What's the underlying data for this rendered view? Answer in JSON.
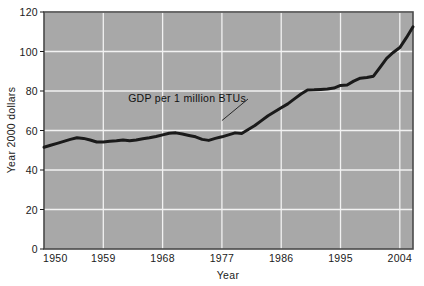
{
  "chart_data": {
    "type": "line",
    "title": "",
    "subtitle": "",
    "xlabel": "Year",
    "ylabel": "Year 2000 dollars",
    "xlim": [
      1950,
      2006
    ],
    "ylim": [
      0,
      120
    ],
    "xticks": [
      "1950",
      "1959",
      "1968",
      "1977",
      "1986",
      "1995",
      "2004"
    ],
    "xtick_values": [
      1950,
      1959,
      1968,
      1977,
      1986,
      1995,
      2004
    ],
    "yticks": [
      "0",
      "20",
      "40",
      "60",
      "80",
      "100",
      "120"
    ],
    "ytick_values": [
      0,
      20,
      40,
      60,
      80,
      100,
      120
    ],
    "grid": true,
    "grid_color": "#f2f2f2",
    "plot_background": "#a8a8a8",
    "legend": "none",
    "annotations": [
      {
        "text": "GDP per 1 million BTUs",
        "x": 1972,
        "y": 70,
        "leader_to_x": 1977,
        "leader_to_y": 65
      }
    ],
    "series": [
      {
        "name": "GDP per 1 million BTUs",
        "color": "#1a1a1a",
        "line_width": 3,
        "x": [
          1950,
          1951,
          1952,
          1953,
          1954,
          1955,
          1956,
          1957,
          1958,
          1959,
          1960,
          1961,
          1962,
          1963,
          1964,
          1965,
          1966,
          1967,
          1968,
          1969,
          1970,
          1971,
          1972,
          1973,
          1974,
          1975,
          1976,
          1977,
          1978,
          1979,
          1980,
          1981,
          1982,
          1983,
          1984,
          1985,
          1986,
          1987,
          1988,
          1989,
          1990,
          1991,
          1992,
          1993,
          1994,
          1995,
          1996,
          1997,
          1998,
          1999,
          2000,
          2001,
          2002,
          2003,
          2004,
          2005,
          2006
        ],
        "values": [
          51.5,
          52.5,
          53.5,
          54.5,
          55.5,
          56.3,
          56.0,
          55.2,
          54.2,
          54.2,
          54.5,
          54.8,
          55.2,
          54.8,
          55.2,
          55.8,
          56.3,
          57.0,
          57.8,
          58.6,
          58.8,
          58.2,
          57.5,
          56.8,
          55.5,
          55.0,
          56.0,
          56.8,
          57.8,
          58.8,
          58.5,
          60.5,
          62.5,
          65.0,
          67.5,
          69.5,
          71.5,
          73.5,
          76.0,
          78.5,
          80.5,
          80.6,
          80.8,
          81.0,
          81.5,
          82.8,
          83.0,
          85.0,
          86.5,
          86.8,
          87.5,
          92.0,
          96.5,
          99.5,
          102.0,
          107.0,
          112.5
        ]
      }
    ]
  },
  "axes": {
    "x_title": "Year",
    "y_title": "Year 2000 dollars"
  }
}
